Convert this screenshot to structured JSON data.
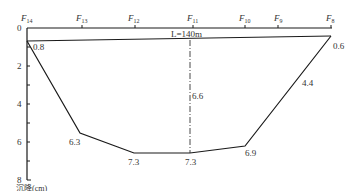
{
  "diagram": {
    "title_length_label": "L=140m",
    "y_axis": {
      "label": "沉降(cm)",
      "ticks": [
        "0",
        "2",
        "4",
        "6",
        "8"
      ],
      "range": [
        0,
        8
      ]
    },
    "stations": [
      {
        "name": "F",
        "sub": "14",
        "x": 27
      },
      {
        "name": "F",
        "sub": "13",
        "x": 82
      },
      {
        "name": "F",
        "sub": "12",
        "x": 135
      },
      {
        "name": "F",
        "sub": "11",
        "x": 193
      },
      {
        "name": "F",
        "sub": "10",
        "x": 245
      },
      {
        "name": "F",
        "sub": "9",
        "x": 278
      },
      {
        "name": "F",
        "sub": "8",
        "x": 331
      }
    ],
    "settlement_points": [
      {
        "label": "0.8",
        "value": 0.8
      },
      {
        "label": "6.3",
        "value": 6.3
      },
      {
        "label": "7.3",
        "value": 7.3
      },
      {
        "label": "7.3",
        "value": 7.3
      },
      {
        "label": "6.9",
        "value": 6.9
      },
      {
        "label": "4.4",
        "value": 4.4
      },
      {
        "label": "0.6",
        "value": 0.6
      }
    ],
    "centerline_label": "6.6",
    "colors": {
      "line": "#1a1a1a",
      "text": "#333333"
    }
  }
}
